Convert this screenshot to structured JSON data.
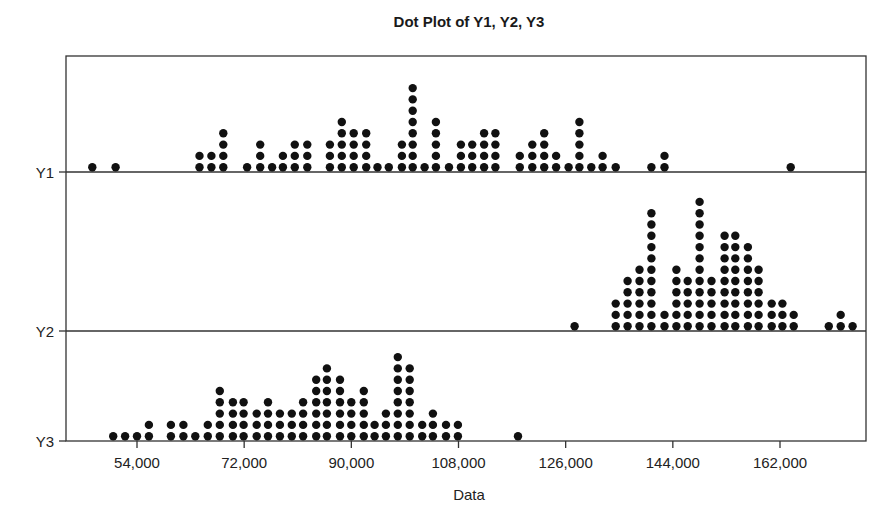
{
  "chart_data": {
    "type": "scatter",
    "subtype": "dotplot",
    "title": "Dot Plot of Y1, Y2, Y3",
    "xlabel": "Data",
    "ylabel": "",
    "xlim": [
      43000,
      172500
    ],
    "xticks": [
      54000,
      72000,
      90000,
      108000,
      126000,
      144000,
      162000
    ],
    "xtick_labels": [
      "54,000",
      "72,000",
      "90,000",
      "108,000",
      "126,000",
      "144,000",
      "162,000"
    ],
    "grid": false,
    "legend": "none",
    "series": [
      {
        "name": "Y1",
        "dots": [
          {
            "x": 46500,
            "count": 1
          },
          {
            "x": 50400,
            "count": 1
          },
          {
            "x": 64500,
            "count": 2
          },
          {
            "x": 66500,
            "count": 2
          },
          {
            "x": 68500,
            "count": 4
          },
          {
            "x": 72500,
            "count": 1
          },
          {
            "x": 74700,
            "count": 3
          },
          {
            "x": 76700,
            "count": 1
          },
          {
            "x": 78500,
            "count": 2
          },
          {
            "x": 80500,
            "count": 3
          },
          {
            "x": 82600,
            "count": 3
          },
          {
            "x": 86400,
            "count": 3
          },
          {
            "x": 88400,
            "count": 5
          },
          {
            "x": 90400,
            "count": 4
          },
          {
            "x": 92500,
            "count": 4
          },
          {
            "x": 94400,
            "count": 1
          },
          {
            "x": 96300,
            "count": 1
          },
          {
            "x": 98500,
            "count": 3
          },
          {
            "x": 100300,
            "count": 8
          },
          {
            "x": 102300,
            "count": 1
          },
          {
            "x": 104200,
            "count": 5
          },
          {
            "x": 106400,
            "count": 1
          },
          {
            "x": 108400,
            "count": 3
          },
          {
            "x": 110300,
            "count": 3
          },
          {
            "x": 112300,
            "count": 4
          },
          {
            "x": 114200,
            "count": 4
          },
          {
            "x": 118300,
            "count": 2
          },
          {
            "x": 120400,
            "count": 3
          },
          {
            "x": 122400,
            "count": 4
          },
          {
            "x": 124400,
            "count": 2
          },
          {
            "x": 126500,
            "count": 1
          },
          {
            "x": 128300,
            "count": 5
          },
          {
            "x": 130300,
            "count": 1
          },
          {
            "x": 132200,
            "count": 2
          },
          {
            "x": 134400,
            "count": 1
          },
          {
            "x": 140400,
            "count": 1
          },
          {
            "x": 142600,
            "count": 2
          },
          {
            "x": 163800,
            "count": 1
          }
        ]
      },
      {
        "name": "Y2",
        "dots": [
          {
            "x": 127500,
            "count": 1
          },
          {
            "x": 134400,
            "count": 3
          },
          {
            "x": 136400,
            "count": 5
          },
          {
            "x": 138400,
            "count": 6
          },
          {
            "x": 140400,
            "count": 11
          },
          {
            "x": 142600,
            "count": 2
          },
          {
            "x": 144600,
            "count": 6
          },
          {
            "x": 146500,
            "count": 5
          },
          {
            "x": 148500,
            "count": 12
          },
          {
            "x": 150500,
            "count": 5
          },
          {
            "x": 152700,
            "count": 9
          },
          {
            "x": 154500,
            "count": 9
          },
          {
            "x": 156600,
            "count": 8
          },
          {
            "x": 158400,
            "count": 6
          },
          {
            "x": 160600,
            "count": 3
          },
          {
            "x": 162400,
            "count": 3
          },
          {
            "x": 164300,
            "count": 2
          },
          {
            "x": 170200,
            "count": 1
          },
          {
            "x": 172200,
            "count": 2
          },
          {
            "x": 174200,
            "count": 1
          }
        ]
      },
      {
        "name": "Y3",
        "dots": [
          {
            "x": 50000,
            "count": 1
          },
          {
            "x": 52000,
            "count": 1
          },
          {
            "x": 54000,
            "count": 1
          },
          {
            "x": 56000,
            "count": 2
          },
          {
            "x": 59700,
            "count": 2
          },
          {
            "x": 61800,
            "count": 2
          },
          {
            "x": 63800,
            "count": 1
          },
          {
            "x": 65900,
            "count": 2
          },
          {
            "x": 67900,
            "count": 5
          },
          {
            "x": 70100,
            "count": 4
          },
          {
            "x": 71900,
            "count": 4
          },
          {
            "x": 74100,
            "count": 3
          },
          {
            "x": 76000,
            "count": 4
          },
          {
            "x": 78000,
            "count": 3
          },
          {
            "x": 80000,
            "count": 3
          },
          {
            "x": 81900,
            "count": 4
          },
          {
            "x": 84100,
            "count": 6
          },
          {
            "x": 85900,
            "count": 7
          },
          {
            "x": 88100,
            "count": 6
          },
          {
            "x": 90000,
            "count": 4
          },
          {
            "x": 92100,
            "count": 5
          },
          {
            "x": 93900,
            "count": 2
          },
          {
            "x": 95800,
            "count": 3
          },
          {
            "x": 97800,
            "count": 8
          },
          {
            "x": 99800,
            "count": 7
          },
          {
            "x": 101900,
            "count": 2
          },
          {
            "x": 103700,
            "count": 3
          },
          {
            "x": 105900,
            "count": 2
          },
          {
            "x": 107900,
            "count": 2
          },
          {
            "x": 118000,
            "count": 1
          }
        ]
      }
    ]
  }
}
